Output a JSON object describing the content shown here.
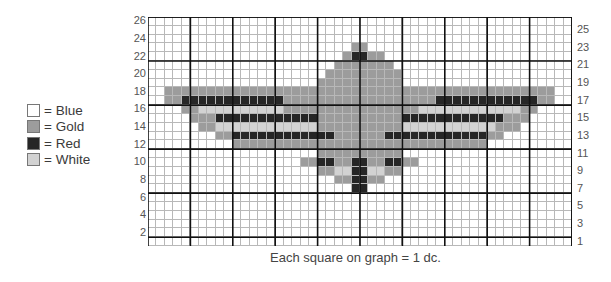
{
  "legend": [
    {
      "label": "= Blue",
      "color": "#ffffff"
    },
    {
      "label": "= Gold",
      "color": "#9c9c9c"
    },
    {
      "label": "= Red",
      "color": "#262626"
    },
    {
      "label": "= White",
      "color": "#d2d2d2"
    }
  ],
  "grid": {
    "columns": 50,
    "rows": 26,
    "left_axis_labels": [
      "26",
      "24",
      "22",
      "20",
      "18",
      "16",
      "14",
      "12",
      "10",
      "8",
      "6",
      "4",
      "2"
    ],
    "right_axis_labels": [
      "25",
      "23",
      "21",
      "19",
      "17",
      "15",
      "13",
      "11",
      "9",
      "7",
      "5",
      "3",
      "1"
    ],
    "palette": {
      "B": "#ffffff",
      "G": "#9c9c9c",
      "R": "#262626",
      "W": "#d2d2d2"
    },
    "pattern_rows_top_to_bottom": [
      "BBBBBBBBBBBBBBBBBBBBBBBBBBBBBBBBBBBBBBBBBBBBBBBBBB",
      "BBBBBBBBBBBBBBBBBBBBBBBBBBBBBBBBBBBBBBBBBBBBBBBBBB",
      "BBBBBBBBBBBBBBBBBBBBBBBBBBBBBBBBBBBBBBBBBBBBBBBBBB",
      "BBBBBBBBBBBBBBBBBBBBBBBBGGBBBBBBBBBBBBBBBBBBBBBBBB",
      "BBBBBBBBBBBBBBBBBBBBBBBGRRGGBBBBBBBBBBBBBBBBBBBBBB",
      "BBBBBBBBBBBBBBBBBBBBBBGGGGGGGBBBBBBBBBBBBBBBBBBBBB",
      "BBBBBBBBBBBBBBBBBBBBBGGGGGGGGGBBBBBBBBBBBBBBBBBBBB",
      "BBBBBBBBBBBBBBBBBBBBGGGGGGGGGGBBBBBBBBBBBBBBBBBBBB",
      "BBGGGGGGGGGGGGGGGGGGGGGGGGGGGGGGGGGGGGGGGGGGGGGGBB",
      "BBGGRRRRRRRRRRRRGGGGGGGGGGGGGGGGGGRRRRRRRRRRRRGGBB",
      "BBBBGGWWWWWWWWWWGGGGGGGGGGGGGGGGWWWWWWWWWWWWGGBBBB",
      "BBBBBGGGRRRRRRRRRRRRGGGGGGGGGGRRRRRRRRRRRRGGGBBBBB",
      "BBBBBBGGWWWWWWWWWWWWGGGGGGGGGGWWWWWWWWWWWGGGBBBBBB",
      "BBBBBBBBGGRRRRRRRRRRRRGGGGGGRRRRRRRRRRRRGGBBBBBBBB",
      "BBBBBBBBBBGGGGGGGGGGGGGGGGGGGGGGGGGGGGGGBBBBBBBBBB",
      "BBBBBBBBBBBBBBBBBBBBGGGGGGGGGGBBBBBBBBBBBBBBBBBBBB",
      "BBBBBBBBBBBBBBBBBBGGRRGGRRGGRRGGBBBBBBBBBBBBBBBBBB",
      "BBBBBBBBBBBBBBBBBBBBGGWWRRWWGGBBBBBBBBBBBBBBBBBBBB",
      "BBBBBBBBBBBBBBBBBBBBBBGGRRGGBBBBBBBBBBBBBBBBBBBBBB",
      "BBBBBBBBBBBBBBBBBBBBBBBBRRBBBBBBBBBBBBBBBBBBBBBBBB",
      "BBBBBBBBBBBBBBBBBBBBBBBBBBBBBBBBBBBBBBBBBBBBBBBBBB",
      "BBBBBBBBBBBBBBBBBBBBBBBBBBBBBBBBBBBBBBBBBBBBBBBBBB",
      "BBBBBBBBBBBBBBBBBBBBBBBBBBBBBBBBBBBBBBBBBBBBBBBBBB",
      "BBBBBBBBBBBBBBBBBBBBBBBBBBBBBBBBBBBBBBBBBBBBBBBBBB",
      "BBBBBBBBBBBBBBBBBBBBBBBBBBBBBBBBBBBBBBBBBBBBBBBBBB",
      "BBBBBBBBBBBBBBBBBBBBBBBBBBBBBBBBBBBBBBBBBBBBBBBBBB"
    ]
  },
  "caption": "Each square on graph = 1 dc."
}
